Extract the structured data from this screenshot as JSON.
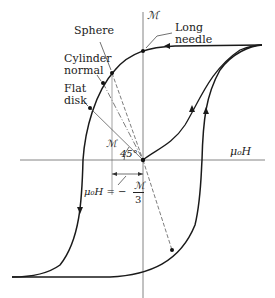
{
  "diagram": {
    "axes": {
      "y_label": "ℳ",
      "x_label": "μ₀H"
    },
    "labels": {
      "sphere": "Sphere",
      "cylinder_line1": "Cylinder",
      "cylinder_line2": "normal",
      "flat_line1": "Flat",
      "flat_line2": "disk",
      "needle_line1": "Long",
      "needle_line2": "needle",
      "m_small": "ℳ",
      "angle": "45°",
      "eq_lhs": "μ₀H = −",
      "eq_num": "ℳ",
      "eq_den": "3"
    },
    "colors": {
      "curve": "#1a1a1a",
      "axis": "#555555",
      "dashed": "#444444"
    }
  }
}
